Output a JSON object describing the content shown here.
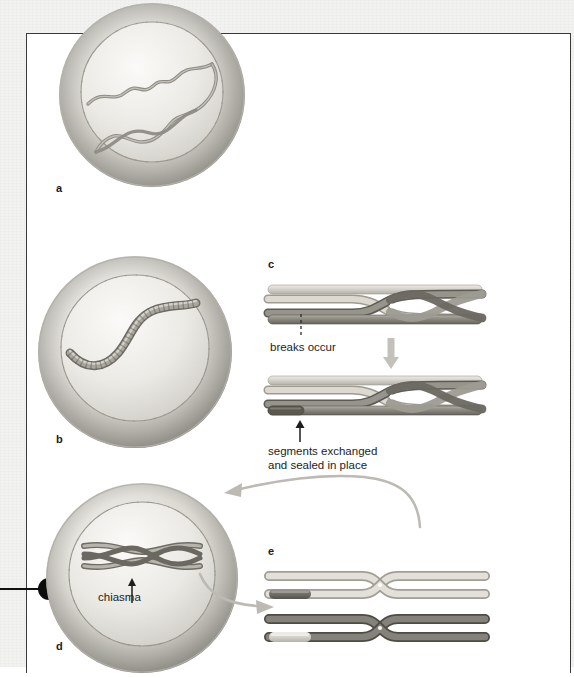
{
  "figure": {
    "panels": [
      {
        "id": "a",
        "label": "a",
        "caption": "",
        "stage": "leptotene-zygotene nucleus with two thin intertwined homologous chromosome threads"
      },
      {
        "id": "b",
        "label": "b",
        "caption": "",
        "stage": "pachytene nucleus with a single thick synapsed bivalent"
      },
      {
        "id": "c",
        "label": "c",
        "caption": "",
        "stage": "detail of crossing over between chromatids",
        "annotations": [
          {
            "id": "breaks",
            "text": "breaks occur"
          },
          {
            "id": "exchanged",
            "line1": "segments exchanged",
            "line2": "and sealed in place"
          }
        ]
      },
      {
        "id": "d",
        "label": "d",
        "caption": "",
        "stage": "diplotene nucleus showing bivalent held together at a chiasma",
        "annotations": [
          {
            "id": "chiasma",
            "text": "chiasma"
          }
        ]
      },
      {
        "id": "e",
        "label": "e",
        "caption": "",
        "stage": "two separated homologues each with one parental and one recombinant chromatid"
      }
    ]
  },
  "colors": {
    "chromatid_light": "#d8d6cf",
    "chromatid_light_shade": "#b9b6ad",
    "chromatid_dark": "#8a8880",
    "chromatid_dark_shade": "#6a685f",
    "nucleus_envelope": "#c9c7c0",
    "nucleus_interior": "#e6e4df",
    "arrow_gray": "#b3b1aa",
    "text": "#1d1d1d",
    "frame": "#3a3a3a",
    "marker": "#0c0c0c",
    "paper": "#f2f2f1"
  },
  "icons": {
    "down_arrow": "down-arrow-icon",
    "up_arrow": "up-arrow-icon",
    "curved_arrow": "curved-arrow-icon",
    "dashed_break_line": "dashed-break-line-icon",
    "margin_dot": "margin-dot-marker"
  }
}
